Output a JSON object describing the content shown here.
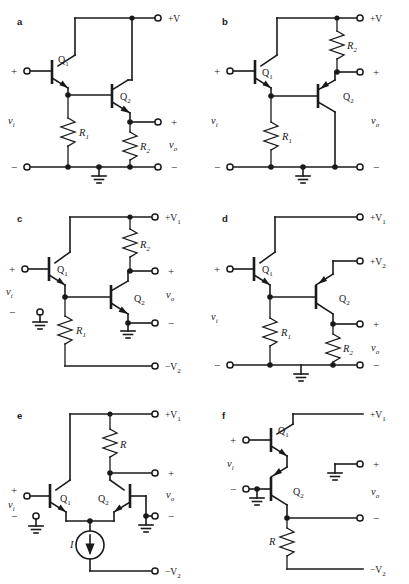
{
  "figure": {
    "background": "#ffffff",
    "ink": "#1a1a1a",
    "panel_count": 6
  },
  "common": {
    "plus": "+",
    "minus": "−",
    "vi": "v",
    "vi_sub": "i",
    "vo": "v",
    "vo_sub": "o",
    "q1": "Q",
    "q1_sub": "1",
    "q2": "Q",
    "q2_sub": "2",
    "r1": "R",
    "r1_sub": "1",
    "r2": "R",
    "r2_sub": "2",
    "r": "R",
    "i": "I",
    "vplus": "+V",
    "vplus1": "+V",
    "vplus2": "+V",
    "vminus2": "−V",
    "sub1": "1",
    "sub2": "2"
  },
  "panels": [
    {
      "id": "a",
      "letter": "a",
      "rail_top": "+V",
      "rail_top_sub": "",
      "rail_bottom": "",
      "rail_bottom_sub": "",
      "devices": [
        "Q1",
        "Q2"
      ],
      "resistors": [
        "R1",
        "R2"
      ],
      "input_label": "vi",
      "output_label": "vo",
      "has_ground": true,
      "ground_count": 1,
      "current_source": false,
      "description": "Darlington-style emitter follower with R1 and R2 to ground, single +V rail"
    },
    {
      "id": "b",
      "letter": "b",
      "rail_top": "+V",
      "rail_top_sub": "",
      "rail_bottom": "",
      "rail_bottom_sub": "",
      "devices": [
        "Q1",
        "Q2"
      ],
      "resistors": [
        "R1",
        "R2"
      ],
      "input_label": "vi",
      "output_label": "vo",
      "has_ground": true,
      "ground_count": 1,
      "current_source": false,
      "description": "Output taken at collector of Q2 through R2 from +V rail"
    },
    {
      "id": "c",
      "letter": "c",
      "rail_top": "+V",
      "rail_top_sub": "1",
      "rail_bottom": "−V",
      "rail_bottom_sub": "2",
      "devices": [
        "Q1",
        "Q2"
      ],
      "resistors": [
        "R1",
        "R2"
      ],
      "input_label": "vi",
      "output_label": "vo",
      "has_ground": true,
      "ground_count": 2,
      "current_source": false,
      "description": "Split supply, R1 returned to −V2, output at Q2 collector via R2"
    },
    {
      "id": "d",
      "letter": "d",
      "rail_top": "+V",
      "rail_top_sub": "1",
      "rail_mid": "+V",
      "rail_mid_sub": "2",
      "rail_bottom": "",
      "rail_bottom_sub": "",
      "devices": [
        "Q1",
        "Q2"
      ],
      "resistors": [
        "R1",
        "R2"
      ],
      "input_label": "vi",
      "output_label": "vo",
      "has_ground": true,
      "ground_count": 1,
      "current_source": false,
      "description": "Two positive rails +V1 and +V2, Q2 collector to +V2, output across R2"
    },
    {
      "id": "e",
      "letter": "e",
      "rail_top": "+V",
      "rail_top_sub": "1",
      "rail_bottom": "−V",
      "rail_bottom_sub": "2",
      "devices": [
        "Q1",
        "Q2"
      ],
      "resistors": [
        "R"
      ],
      "input_label": "vi",
      "output_label": "vo",
      "has_ground": true,
      "ground_count": 2,
      "current_source": true,
      "current_source_label": "I",
      "description": "Differential pair with tail current source I and collector resistor R"
    },
    {
      "id": "f",
      "letter": "f",
      "rail_top": "+V",
      "rail_top_sub": "1",
      "rail_bottom": "−V",
      "rail_bottom_sub": "2",
      "devices": [
        "Q1",
        "Q2"
      ],
      "resistors": [
        "R"
      ],
      "input_label": "vi",
      "output_label": "vo",
      "has_ground": true,
      "ground_count": 2,
      "current_source": false,
      "description": "Cascaded NPN-NPN pair with emitter resistor R to −V2"
    }
  ]
}
